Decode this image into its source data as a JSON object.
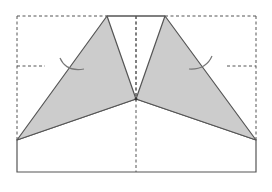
{
  "diagram": {
    "type": "origami-fold-step",
    "colors": {
      "background": "#ffffff",
      "paper_fill": "#ffffff",
      "folded_fill": "#cccccc",
      "line": "#555555",
      "dashed_line": "#555555",
      "arrow": "#777777"
    },
    "outline": {
      "left": 17,
      "right": 256,
      "top": 16,
      "bottom": 172
    },
    "points": {
      "left_apex": [
        107,
        16
      ],
      "right_apex": [
        165,
        16
      ],
      "center": [
        136,
        99
      ],
      "left_corner": [
        17,
        140
      ],
      "right_corner": [
        256,
        140
      ]
    },
    "guides": {
      "vertical_center_x": 136,
      "horizontal_mid_y": 66
    },
    "flaps": [
      {
        "name": "left-flap",
        "points": [
          [
            107,
            16
          ],
          [
            136,
            99
          ],
          [
            17,
            140
          ]
        ]
      },
      {
        "name": "right-flap",
        "points": [
          [
            165,
            16
          ],
          [
            256,
            140
          ],
          [
            136,
            99
          ]
        ]
      }
    ],
    "arrows": [
      {
        "name": "left-fold-arrow",
        "path": "M 60 58 Q 66 72 84 69"
      },
      {
        "name": "right-fold-arrow",
        "path": "M 212 56 Q 206 70 189 69"
      }
    ]
  }
}
